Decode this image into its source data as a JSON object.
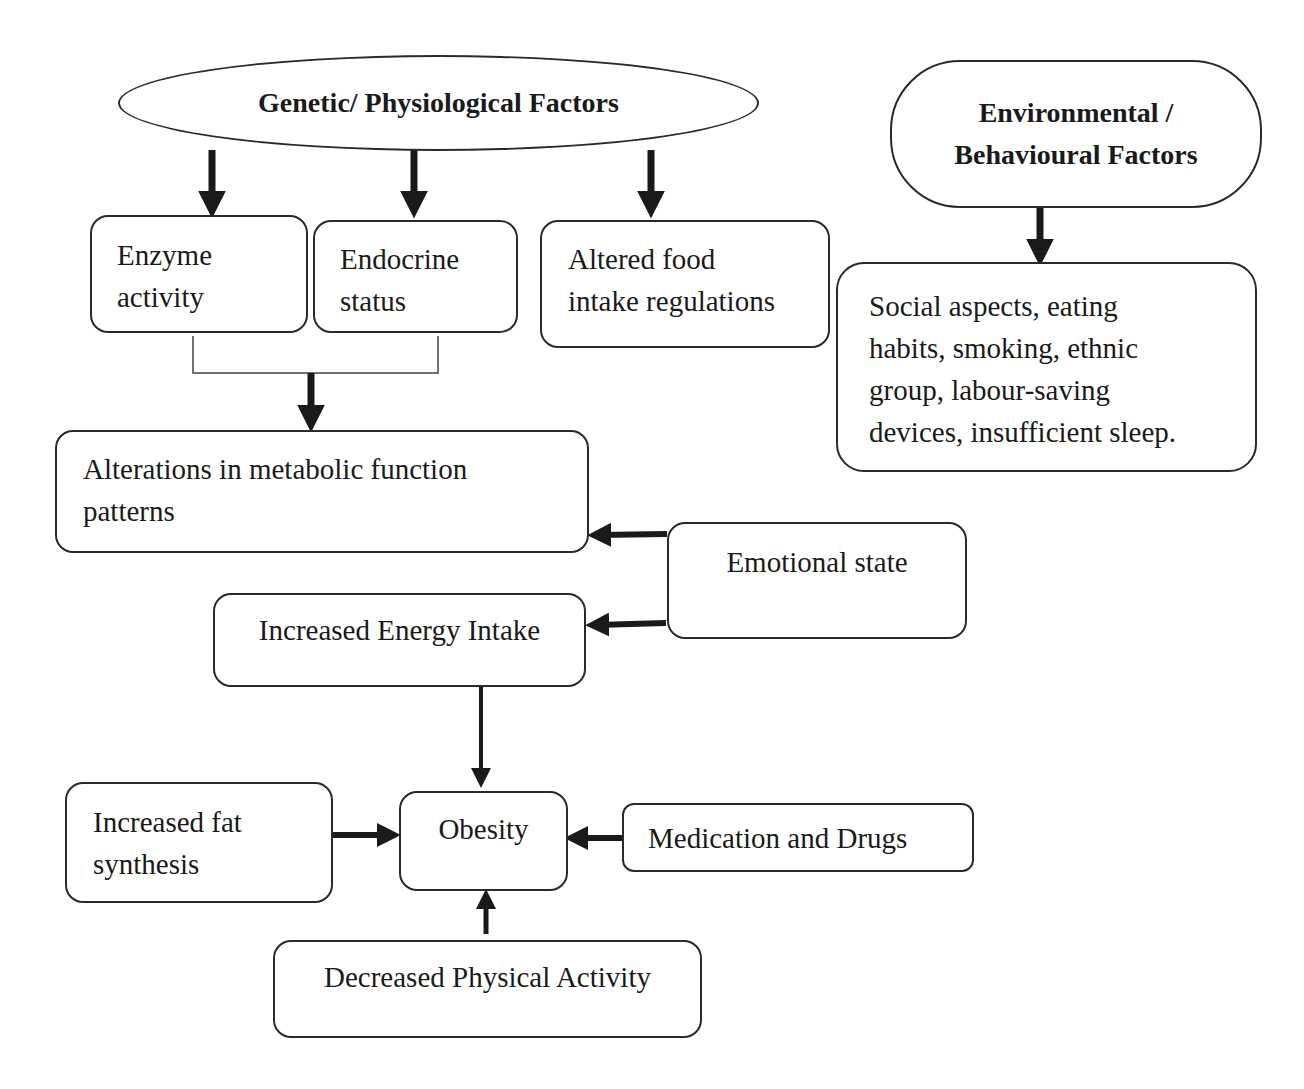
{
  "diagram": {
    "type": "flowchart",
    "topic": "Factors leading to obesity",
    "nodes": {
      "genetic": {
        "label": "Genetic/ Physiological Factors",
        "shape": "ellipse"
      },
      "environmental": {
        "label": "Environmental /\nBehavioural Factors",
        "shape": "pill"
      },
      "enzyme": {
        "label": "Enzyme\nactivity"
      },
      "endocrine": {
        "label": "Endocrine\nstatus"
      },
      "altered_food": {
        "label": "Altered food\nintake regulations"
      },
      "social": {
        "label": "Social aspects, eating\nhabits, smoking, ethnic\ngroup, labour-saving\ndevices, insufficient sleep."
      },
      "alterations": {
        "label": "Alterations in metabolic function\npatterns"
      },
      "emotional": {
        "label": "Emotional state"
      },
      "energy_intake": {
        "label": "Increased Energy Intake"
      },
      "fat_synthesis": {
        "label": "Increased fat\nsynthesis"
      },
      "obesity": {
        "label": "Obesity"
      },
      "medication": {
        "label": "Medication and Drugs"
      },
      "physical_activity": {
        "label": "Decreased Physical Activity"
      }
    },
    "edges": [
      {
        "from": "genetic",
        "to": "enzyme"
      },
      {
        "from": "genetic",
        "to": "endocrine"
      },
      {
        "from": "genetic",
        "to": "altered_food"
      },
      {
        "from": "environmental",
        "to": "social"
      },
      {
        "from": [
          "enzyme",
          "endocrine"
        ],
        "to": "alterations",
        "style": "bracket"
      },
      {
        "from": "emotional",
        "to": "alterations"
      },
      {
        "from": "emotional",
        "to": "energy_intake"
      },
      {
        "from": "energy_intake",
        "to": "obesity"
      },
      {
        "from": "fat_synthesis",
        "to": "obesity"
      },
      {
        "from": "medication",
        "to": "obesity"
      },
      {
        "from": "physical_activity",
        "to": "obesity"
      }
    ],
    "colors": {
      "stroke": "#2a2a2a",
      "arrow": "#1a1a1a",
      "background": "#ffffff"
    }
  }
}
